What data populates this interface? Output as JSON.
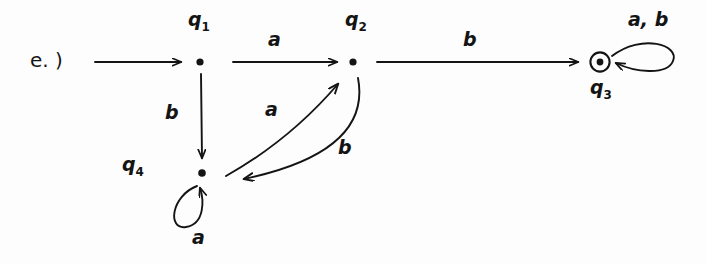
{
  "figure": {
    "prefix_label": "e. )",
    "kind": "finite-state-machine-diagram"
  },
  "states": [
    {
      "id": "q1",
      "label": "q",
      "sub": "1",
      "x": 200,
      "y": 62,
      "accepting": false,
      "label_x": 188,
      "label_y": 10
    },
    {
      "id": "q2",
      "label": "q",
      "sub": "2",
      "x": 353,
      "y": 62,
      "accepting": false,
      "label_x": 345,
      "label_y": 10
    },
    {
      "id": "q3",
      "label": "q",
      "sub": "3",
      "x": 600,
      "y": 62,
      "accepting": true,
      "label_x": 590,
      "label_y": 78
    },
    {
      "id": "q4",
      "label": "q",
      "sub": "4",
      "x": 202,
      "y": 173,
      "accepting": false,
      "label_x": 122,
      "label_y": 155
    }
  ],
  "transitions": [
    {
      "id": "start",
      "from": "",
      "to": "q1",
      "symbol": "",
      "label_x": 0,
      "label_y": 0
    },
    {
      "id": "q1_q2",
      "from": "q1",
      "to": "q2",
      "symbol": "a",
      "label_x": 268,
      "label_y": 30
    },
    {
      "id": "q1_q4",
      "from": "q1",
      "to": "q4",
      "symbol": "b",
      "label_x": 165,
      "label_y": 103
    },
    {
      "id": "q4_q2",
      "from": "q4",
      "to": "q2",
      "symbol": "a",
      "label_x": 265,
      "label_y": 100
    },
    {
      "id": "q2_q4",
      "from": "q2",
      "to": "q4",
      "symbol": "b",
      "label_x": 338,
      "label_y": 138
    },
    {
      "id": "q2_q3",
      "from": "q2",
      "to": "q3",
      "symbol": "b",
      "label_x": 463,
      "label_y": 30
    },
    {
      "id": "q4_q4",
      "from": "q4",
      "to": "q4",
      "symbol": "a",
      "label_x": 192,
      "label_y": 228
    },
    {
      "id": "q3_q3",
      "from": "q3",
      "to": "q3",
      "symbol": "a, b",
      "label_x": 628,
      "label_y": 10
    }
  ],
  "colors": {
    "ink": "#141414",
    "background": "#fdfdfd"
  }
}
